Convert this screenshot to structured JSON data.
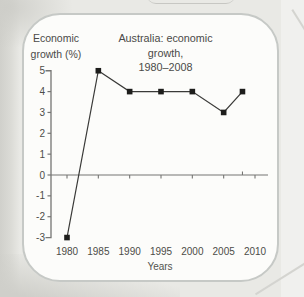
{
  "page": {
    "background_color": "#e9e9e5",
    "card_background": "#fcfcfa",
    "card_border_color": "#c6c9c6"
  },
  "chart_data": {
    "type": "line",
    "title_line1": "Australia: economic growth,",
    "title_line2": "1980–2008",
    "ylabel_line1": "Economic",
    "ylabel_line2": "growth (%)",
    "xlabel": "Years",
    "x": [
      1980,
      1985,
      1990,
      1995,
      2000,
      2005,
      2008
    ],
    "values": [
      -3,
      5,
      4,
      4,
      4,
      3,
      4
    ],
    "x_ticks": [
      1980,
      1985,
      1990,
      1995,
      2000,
      2005,
      2010
    ],
    "y_ticks": [
      5,
      4,
      3,
      2,
      1,
      0,
      -1,
      -2,
      -3
    ],
    "ylim": [
      -3,
      5
    ],
    "xlim": [
      1977.5,
      2012
    ],
    "x_tick_above_axis": 2008,
    "marker": "square",
    "grid": false,
    "legend": "none",
    "line_color": "#3a3a38",
    "marker_color": "#1d1d1b",
    "axis_color": "#757573",
    "text_color": "#4c4c48"
  }
}
